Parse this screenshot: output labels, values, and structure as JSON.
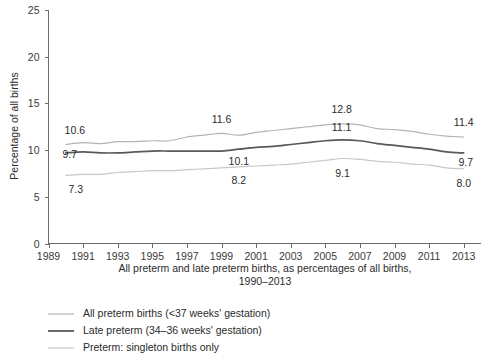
{
  "chart_data": {
    "type": "line",
    "title": "",
    "xlabel": "All preterm and late preterm births, as percentages of all births, 1990–2013",
    "ylabel": "Percentage of all births",
    "xlim": [
      1989,
      2014
    ],
    "ylim": [
      0,
      25
    ],
    "grid": false,
    "legend_position": "below-left",
    "x_ticks": [
      "1989",
      "1991",
      "1993",
      "1995",
      "1997",
      "1999",
      "2001",
      "2003",
      "2005",
      "2007",
      "2009",
      "2011",
      "2013"
    ],
    "y_ticks": [
      "0",
      "5",
      "10",
      "15",
      "20",
      "25"
    ],
    "x": [
      1990,
      1991,
      1992,
      1993,
      1994,
      1995,
      1996,
      1997,
      1998,
      1999,
      2000,
      2001,
      2002,
      2003,
      2004,
      2005,
      2006,
      2007,
      2008,
      2009,
      2010,
      2011,
      2012,
      2013
    ],
    "series": [
      {
        "name": "All preterm births (<37 weeks' gestation)",
        "color": "#b4b4b4",
        "width": 1.2,
        "values": [
          10.6,
          10.8,
          10.7,
          10.9,
          10.9,
          11.0,
          11.0,
          11.4,
          11.6,
          11.8,
          11.6,
          11.9,
          12.1,
          12.3,
          12.5,
          12.7,
          12.8,
          12.7,
          12.3,
          12.2,
          12.0,
          11.7,
          11.5,
          11.4
        ]
      },
      {
        "name": "Late preterm (34–36 weeks' gestation)",
        "color": "#595959",
        "width": 1.7,
        "values": [
          9.7,
          9.8,
          9.7,
          9.7,
          9.8,
          9.9,
          9.9,
          9.9,
          9.9,
          9.9,
          10.1,
          10.3,
          10.4,
          10.6,
          10.8,
          11.0,
          11.1,
          11.0,
          10.7,
          10.5,
          10.3,
          10.1,
          9.8,
          9.7
        ]
      },
      {
        "name": "Preterm: singleton births only",
        "color": "#c8c8c8",
        "width": 1.2,
        "values": [
          7.3,
          7.4,
          7.4,
          7.6,
          7.7,
          7.8,
          7.8,
          7.9,
          8.0,
          8.1,
          8.2,
          8.3,
          8.4,
          8.5,
          8.7,
          8.9,
          9.1,
          9.0,
          8.8,
          8.7,
          8.5,
          8.4,
          8.1,
          8.0
        ]
      }
    ],
    "annotations": [
      {
        "text": "10.6",
        "series": 0,
        "year": 1990,
        "dx": 9,
        "dy": -10
      },
      {
        "text": "11.6",
        "series": 0,
        "year": 1999,
        "dx": 0,
        "dy": -10
      },
      {
        "text": "12.8",
        "series": 0,
        "year": 2006,
        "dx": -1,
        "dy": -11
      },
      {
        "text": "11.4",
        "series": 0,
        "year": 2013,
        "dx": 0,
        "dy": -11
      },
      {
        "text": "9.7",
        "series": 1,
        "year": 1990,
        "dx": 4,
        "dy": 5
      },
      {
        "text": "10.1",
        "series": 1,
        "year": 2000,
        "dx": 0,
        "dy": 16
      },
      {
        "text": "11.1",
        "series": 1,
        "year": 2006,
        "dx": -1,
        "dy": -9
      },
      {
        "text": "9.7",
        "series": 1,
        "year": 2013,
        "dx": 2,
        "dy": 13
      },
      {
        "text": "7.3",
        "series": 2,
        "year": 1990,
        "dx": 10,
        "dy": 18
      },
      {
        "text": "8.2",
        "series": 2,
        "year": 2000,
        "dx": 0,
        "dy": 17
      },
      {
        "text": "9.1",
        "series": 2,
        "year": 2006,
        "dx": 0,
        "dy": 18
      },
      {
        "text": "8.0",
        "series": 2,
        "year": 2013,
        "dx": 0,
        "dy": 18
      }
    ]
  },
  "xaxis_caption": {
    "line1": "All preterm and late preterm births, as percentages of all births,",
    "line2": "1990–2013"
  },
  "yaxis": {
    "title": "Percentage of all births"
  },
  "legend": {
    "items": [
      {
        "label": "All preterm births (<37 weeks' gestation)",
        "color": "#b4b4b4",
        "width": 1.2
      },
      {
        "label": "Late preterm (34–36 weeks' gestation)",
        "color": "#595959",
        "width": 1.8
      },
      {
        "label": "Preterm: singleton births only",
        "color": "#c8c8c8",
        "width": 1.2
      }
    ]
  }
}
